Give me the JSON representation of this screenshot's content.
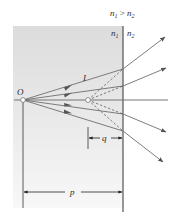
{
  "figure": {
    "condition_label": {
      "n": "n",
      "sub1": "1",
      "op": " > ",
      "n2": "n",
      "sub2": "2"
    },
    "medium_left_label": {
      "n": "n",
      "sub": "1"
    },
    "medium_right_label": {
      "n": "n",
      "sub": "2"
    },
    "object_label": "O",
    "image_label": "I",
    "image_distance_label": "q",
    "object_distance_label": "p",
    "colors": {
      "medium_shade": "#e6e6e6",
      "ray": "#6e6e6e",
      "arrow": "#4a4a4a",
      "line": "#333333"
    }
  }
}
